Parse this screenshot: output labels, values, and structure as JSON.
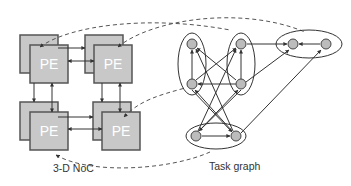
{
  "diagram": {
    "noc": {
      "caption": "3-D NoC",
      "pe_label": "PE",
      "pe_fill": "#c8c8c8",
      "pe_stroke": "#555555",
      "tiles": [
        {
          "id": "pe-top-left",
          "label": "PE"
        },
        {
          "id": "pe-top-right",
          "label": "PE"
        },
        {
          "id": "pe-bottom-left",
          "label": "PE"
        },
        {
          "id": "pe-bottom-right",
          "label": "PE"
        }
      ]
    },
    "task_graph": {
      "caption": "Task graph",
      "node_fill": "#bcbcbc",
      "node_count": 8,
      "cluster_count": 4
    },
    "mapping_line_style": "dashed",
    "colors": {
      "edge": "#333333",
      "dashed": "#555555",
      "background": "#ffffff"
    }
  }
}
